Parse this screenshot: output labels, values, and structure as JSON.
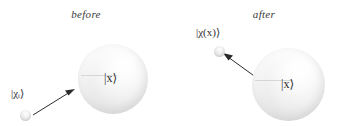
{
  "figure": {
    "background_color": "#ffffff",
    "width": 344,
    "height": 126
  },
  "panels": [
    {
      "id": "before",
      "caption": "before",
      "target": {
        "label": "|x⟩",
        "description": "large shaded sphere representing the target state"
      },
      "probe": {
        "label": "|χᵢ⟩",
        "description": "small shaded sphere representing the incoming probe state"
      },
      "arrow": {
        "direction": "toward-target",
        "description": "arrow from incoming probe pointing up-right at the target sphere"
      }
    },
    {
      "id": "after",
      "caption": "after",
      "target": {
        "label": "|x⟩",
        "description": "large shaded sphere representing the target state"
      },
      "probe": {
        "label": "|χ(x)⟩",
        "description": "small shaded sphere representing the outgoing, entangled probe state"
      },
      "arrow": {
        "direction": "away-from-target",
        "description": "arrow from the target sphere pointing up-left at the outgoing probe"
      }
    }
  ],
  "colors": {
    "text": "#2e2e2e",
    "caption": "#3a3a3a",
    "arrow": "#2b2b2b",
    "sphere_light": "#ffffff",
    "sphere_shadow": "#cfcfcf"
  }
}
